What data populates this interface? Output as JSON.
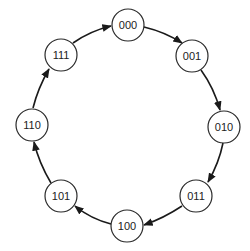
{
  "diagram": {
    "type": "state-cycle",
    "nodes": [
      {
        "id": "000",
        "label": "000",
        "cx": 128,
        "cy": 25
      },
      {
        "id": "001",
        "label": "001",
        "cx": 192,
        "cy": 56
      },
      {
        "id": "010",
        "label": "010",
        "cx": 224,
        "cy": 127
      },
      {
        "id": "011",
        "label": "011",
        "cx": 196,
        "cy": 196
      },
      {
        "id": "100",
        "label": "100",
        "cx": 127,
        "cy": 226
      },
      {
        "id": "101",
        "label": "101",
        "cx": 61,
        "cy": 196
      },
      {
        "id": "110",
        "label": "110",
        "cx": 32,
        "cy": 125
      },
      {
        "id": "111",
        "label": "111",
        "cx": 61,
        "cy": 55
      }
    ],
    "edges": [
      {
        "from": "000",
        "to": "001"
      },
      {
        "from": "001",
        "to": "010"
      },
      {
        "from": "010",
        "to": "011"
      },
      {
        "from": "011",
        "to": "100"
      },
      {
        "from": "100",
        "to": "101"
      },
      {
        "from": "101",
        "to": "110"
      },
      {
        "from": "110",
        "to": "111"
      },
      {
        "from": "111",
        "to": "000"
      }
    ],
    "node_radius": 16,
    "colors": {
      "stroke": "#2a2a2a",
      "fill": "#ffffff",
      "text": "#222222"
    }
  }
}
